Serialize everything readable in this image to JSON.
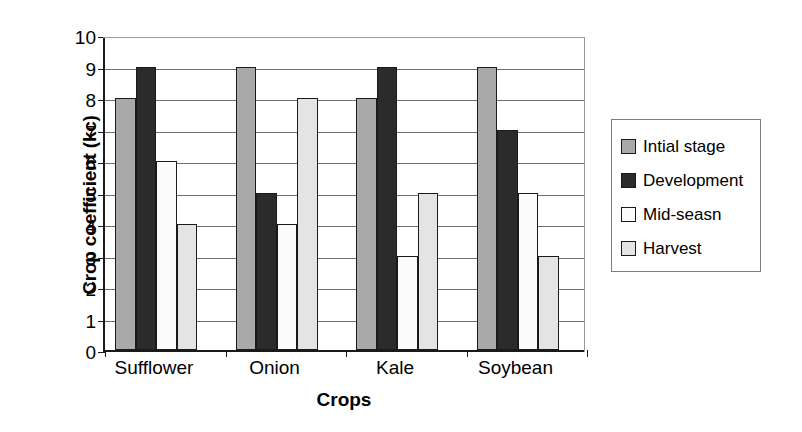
{
  "chart_data": {
    "type": "bar",
    "title": "",
    "xlabel": "Crops",
    "ylabel": "Crop coefficient (kc)",
    "categories": [
      "Sufflower",
      "Onion",
      "Kale",
      "Soybean"
    ],
    "series": [
      {
        "name": "Intial stage",
        "color": "#a9a9a9",
        "values": [
          8,
          9,
          8,
          9
        ]
      },
      {
        "name": "Development",
        "color": "#2b2b2b",
        "values": [
          9,
          5,
          9,
          7
        ]
      },
      {
        "name": "Mid-seasn",
        "color": "#fbfbfb",
        "values": [
          6,
          4,
          3,
          5
        ]
      },
      {
        "name": "Harvest",
        "color": "#e4e4e4",
        "values": [
          4,
          8,
          5,
          3
        ]
      }
    ],
    "ylim": [
      0,
      10
    ],
    "ytick_labels": [
      "0",
      "1",
      "2",
      "3",
      "4",
      "5",
      "6",
      "7",
      "8",
      "9",
      "10"
    ],
    "ytick_values": [
      0,
      1,
      2,
      3,
      4,
      5,
      6,
      7,
      8,
      9,
      10
    ],
    "grid": true,
    "legend_position": "right",
    "bar_edge_color": "#1a1a1a",
    "axis_color": "#1a1a1a",
    "grid_color": "#6e6e6e",
    "background": "#ffffff"
  },
  "legend": {
    "items": [
      {
        "label": "Intial stage",
        "swatch": "#a9a9a9"
      },
      {
        "label": "Development",
        "swatch": "#2b2b2b"
      },
      {
        "label": "Mid-seasn",
        "swatch": "#fbfbfb"
      },
      {
        "label": "Harvest",
        "swatch": "#e4e4e4"
      }
    ]
  }
}
